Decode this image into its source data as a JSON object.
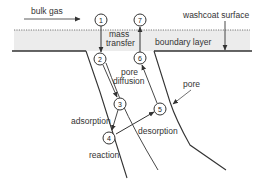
{
  "diagram": {
    "type": "catalytic washcoat pore mass-transfer steps",
    "labels": {
      "bulk_gas": "bulk gas",
      "washcoat_surface": "washcoat surface",
      "boundary_layer": "boundary layer",
      "mass_transfer_line1": "mass",
      "mass_transfer_line2": "transfer",
      "pore_diffusion_line1": "pore",
      "pore_diffusion_line2": "diffusion",
      "adsorption": "adsorption",
      "reaction": "reaction",
      "desorption": "desorption",
      "pore": "pore"
    },
    "steps": [
      {
        "id": "1",
        "label": "1"
      },
      {
        "id": "2",
        "label": "2"
      },
      {
        "id": "3",
        "label": "3"
      },
      {
        "id": "4",
        "label": "4"
      },
      {
        "id": "5",
        "label": "5"
      },
      {
        "id": "6",
        "label": "6"
      },
      {
        "id": "7",
        "label": "7"
      }
    ],
    "flow": [
      "1 → 2 (mass transfer)",
      "2 → 3 (pore diffusion)",
      "3 → 4 (adsorption)",
      "4 → 5 (desorption)",
      "5 → 6 (pore diffusion)",
      "6 → 7 (mass transfer)"
    ],
    "colors": {
      "line": "#333333",
      "boundary_fill": "#ececec",
      "text": "#333333"
    }
  }
}
